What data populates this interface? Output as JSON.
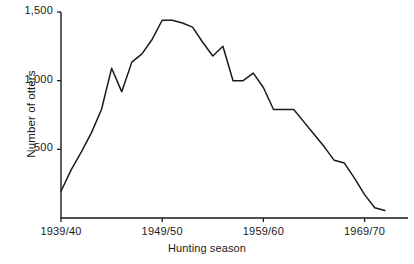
{
  "chart_data": {
    "type": "line",
    "title": "",
    "xlabel": "Hunting season",
    "ylabel": "Number of otters",
    "grid": false,
    "legend": null,
    "ylim": [
      0,
      1500
    ],
    "ytick_labels": [
      "500",
      "1,000",
      "1,500"
    ],
    "ytick_values": [
      500,
      1000,
      1500
    ],
    "xtick_labels": [
      "1939/40",
      "1949/50",
      "1959/60",
      "1969/70"
    ],
    "xtick_values": [
      1939,
      1949,
      1959,
      1969
    ],
    "xlim": [
      1939,
      1971
    ],
    "x": [
      1939,
      1940,
      1941,
      1942,
      1943,
      1944,
      1945,
      1946,
      1947,
      1948,
      1949,
      1950,
      1951,
      1952,
      1953,
      1954,
      1955,
      1956,
      1957,
      1958,
      1959,
      1960,
      1961,
      1962,
      1963,
      1964,
      1965,
      1966,
      1967,
      1968,
      1969,
      1970,
      1971
    ],
    "x_labels": [
      "1939/40",
      "1940/41",
      "1941/42",
      "1942/43",
      "1943/44",
      "1944/45",
      "1945/46",
      "1946/47",
      "1947/48",
      "1948/49",
      "1949/50",
      "1950/51",
      "1951/52",
      "1952/53",
      "1953/54",
      "1954/55",
      "1955/56",
      "1956/57",
      "1957/58",
      "1958/59",
      "1959/60",
      "1960/61",
      "1961/62",
      "1962/63",
      "1963/64",
      "1964/65",
      "1965/66",
      "1966/67",
      "1967/68",
      "1968/69",
      "1969/70",
      "1970/71",
      "1971/72"
    ],
    "values": [
      195,
      350,
      480,
      620,
      790,
      1090,
      920,
      1135,
      1195,
      1300,
      1440,
      1440,
      1420,
      1390,
      1280,
      1180,
      1250,
      1000,
      1000,
      1055,
      950,
      790,
      790,
      790,
      700,
      610,
      520,
      420,
      400,
      290,
      170,
      75,
      55
    ],
    "series": [
      {
        "name": "Number of otters",
        "color": "#1a1a1a",
        "values": [
          195,
          350,
          480,
          620,
          790,
          1090,
          920,
          1135,
          1195,
          1300,
          1440,
          1440,
          1420,
          1390,
          1280,
          1180,
          1250,
          1000,
          1000,
          1055,
          950,
          790,
          790,
          790,
          700,
          610,
          520,
          420,
          400,
          290,
          170,
          75,
          55
        ]
      }
    ],
    "axis_color": "#1a1a1a",
    "line_color": "#1a1a1a",
    "background": "#ffffff"
  },
  "axis": {
    "y_label": "Number of otters",
    "x_label": "Hunting season",
    "y_ticks": [
      {
        "label": "1,500",
        "value": 1500
      },
      {
        "label": "1,000",
        "value": 1000
      },
      {
        "label": "500",
        "value": 500
      }
    ],
    "x_ticks": [
      {
        "label": "1939/40",
        "value": 1939
      },
      {
        "label": "1949/50",
        "value": 1949
      },
      {
        "label": "1959/60",
        "value": 1959
      },
      {
        "label": "1969/70",
        "value": 1969
      }
    ]
  }
}
